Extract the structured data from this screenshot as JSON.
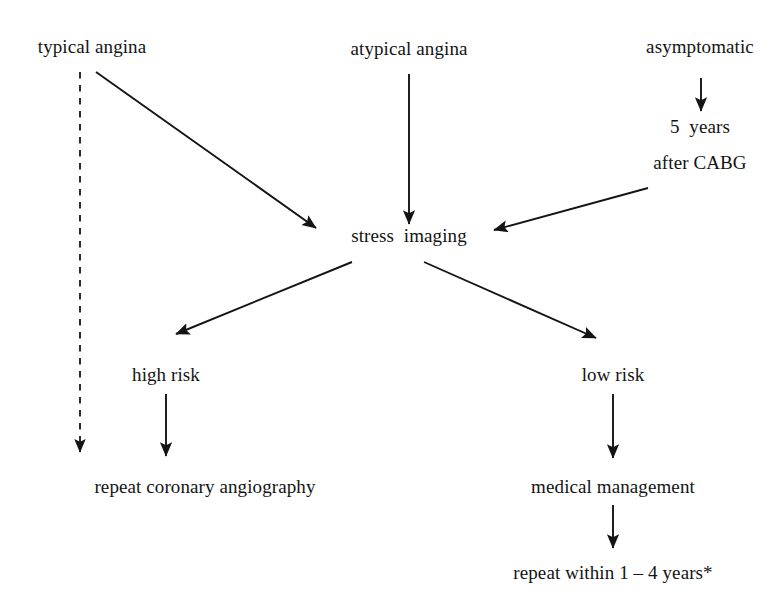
{
  "figure": {
    "type": "flowchart",
    "background_color": "#ffffff",
    "ink_color": "#141414"
  },
  "nodes": {
    "typical_angina": "typical angina",
    "atypical_angina": "atypical angina",
    "asymptomatic": "asymptomatic",
    "five_years": "5  years",
    "after_cabg": "after CABG",
    "stress_imaging": "stress  imaging",
    "high_risk": "high risk",
    "low_risk": "low risk",
    "repeat_coronary_angiography": "repeat coronary angiography",
    "medical_management": "medical management",
    "repeat_within": "repeat within 1 – 4 years*"
  },
  "edges": [
    {
      "name": "typical-angina-to-repeat-angiography",
      "from": "typical_angina",
      "to": "repeat_coronary_angiography",
      "style": "dashed",
      "arrowhead": "filled-triangle",
      "x1": 80,
      "y1": 72,
      "x2": 80,
      "y2": 452
    },
    {
      "name": "typical-angina-to-stress-imaging",
      "from": "typical_angina",
      "to": "stress_imaging",
      "style": "solid",
      "arrowhead": "filled-triangle",
      "x1": 96,
      "y1": 72,
      "x2": 316,
      "y2": 228
    },
    {
      "name": "atypical-angina-to-stress-imaging",
      "from": "atypical_angina",
      "to": "stress_imaging",
      "style": "solid",
      "arrowhead": "filled-triangle",
      "x1": 409,
      "y1": 74,
      "x2": 409,
      "y2": 224
    },
    {
      "name": "asymptomatic-to-five-years",
      "from": "asymptomatic",
      "to": "five_years",
      "style": "solid",
      "arrowhead": "filled-triangle",
      "x1": 701,
      "y1": 78,
      "x2": 701,
      "y2": 111
    },
    {
      "name": "after-cabg-to-stress-imaging",
      "from": "after_cabg",
      "to": "stress_imaging",
      "style": "solid",
      "arrowhead": "filled-triangle",
      "x1": 648,
      "y1": 188,
      "x2": 494,
      "y2": 230
    },
    {
      "name": "stress-imaging-to-high-risk",
      "from": "stress_imaging",
      "to": "high_risk",
      "style": "solid",
      "arrowhead": "filled-triangle",
      "x1": 352,
      "y1": 262,
      "x2": 176,
      "y2": 334
    },
    {
      "name": "stress-imaging-to-low-risk",
      "from": "stress_imaging",
      "to": "low_risk",
      "style": "solid",
      "arrowhead": "filled-triangle",
      "x1": 424,
      "y1": 262,
      "x2": 596,
      "y2": 338
    },
    {
      "name": "high-risk-to-repeat-angiography",
      "from": "high_risk",
      "to": "repeat_coronary_angiography",
      "style": "solid",
      "arrowhead": "filled-triangle",
      "x1": 166,
      "y1": 394,
      "x2": 166,
      "y2": 456
    },
    {
      "name": "low-risk-to-medical-management",
      "from": "low_risk",
      "to": "medical_management",
      "style": "solid",
      "arrowhead": "filled-triangle",
      "x1": 613,
      "y1": 394,
      "x2": 613,
      "y2": 458
    },
    {
      "name": "medical-management-to-repeat-within",
      "from": "medical_management",
      "to": "repeat_within",
      "style": "solid",
      "arrowhead": "filled-triangle",
      "x1": 613,
      "y1": 505,
      "x2": 613,
      "y2": 548
    }
  ]
}
